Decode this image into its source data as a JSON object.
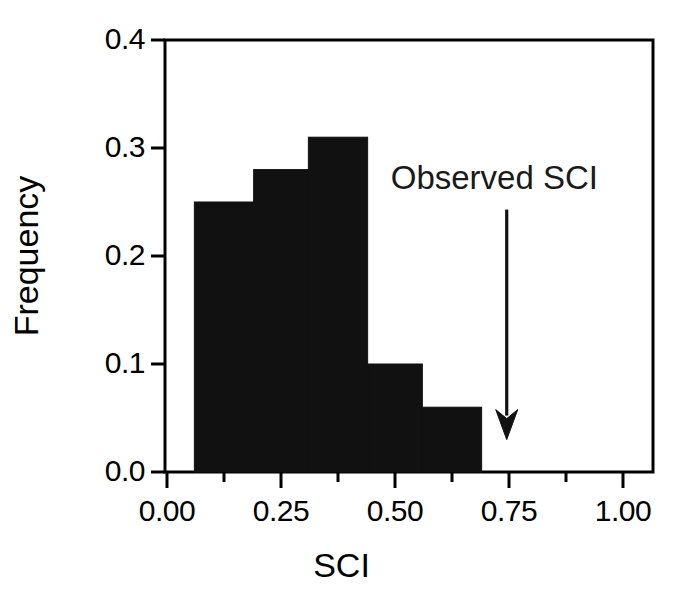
{
  "chart_data": {
    "type": "bar",
    "title": "",
    "subtitle": "",
    "xlabel": "SCI",
    "ylabel": "Frequency",
    "xlim": [
      -0.005,
      1.07
    ],
    "ylim": [
      0.0,
      0.4
    ],
    "grid": false,
    "legend": null,
    "histogram": true,
    "bin_edges": [
      0.06,
      0.19,
      0.31,
      0.44,
      0.56,
      0.69
    ],
    "categories": [
      "0.06-0.19",
      "0.19-0.31",
      "0.31-0.44",
      "0.44-0.56",
      "0.56-0.69"
    ],
    "values": [
      0.25,
      0.28,
      0.31,
      0.1,
      0.06
    ],
    "bar_color": "#111111",
    "xticks": [
      0.0,
      0.25,
      0.5,
      0.75,
      1.0
    ],
    "xtick_labels": [
      "0.00",
      "0.25",
      "0.50",
      "0.75",
      "1.00"
    ],
    "xminor_ticks": [
      0.125,
      0.375,
      0.625,
      0.875
    ],
    "yticks": [
      0.0,
      0.1,
      0.2,
      0.3,
      0.4
    ],
    "ytick_labels": [
      "0.0",
      "0.1",
      "0.2",
      "0.3",
      "0.4"
    ],
    "annotations": [
      {
        "text": "Observed SCI",
        "x": 0.745,
        "y_text": 0.31,
        "arrow_from_y": 0.243,
        "arrow_to_y": 0.03,
        "type": "arrow-annotation"
      }
    ]
  },
  "axes": {
    "x_title": "SCI",
    "y_title": "Frequency",
    "x_tick_labels": [
      "0.00",
      "0.25",
      "0.50",
      "0.75",
      "1.00"
    ],
    "y_tick_labels": [
      "0.0",
      "0.1",
      "0.2",
      "0.3",
      "0.4"
    ]
  },
  "annotation": {
    "label": "Observed SCI"
  },
  "colors": {
    "background": "#ffffff",
    "ink": "#000000",
    "bar_fill": "#111111"
  }
}
